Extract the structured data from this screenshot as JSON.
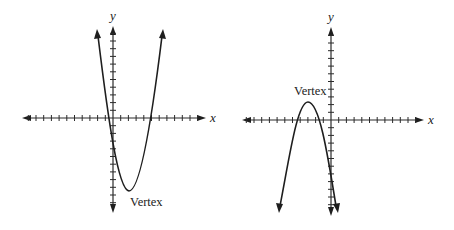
{
  "figure": {
    "graphs": [
      {
        "id": "left",
        "x_axis_label": "x",
        "y_axis_label": "y",
        "annotation": "Vertex",
        "opens": "up",
        "vertex_position": "below x-axis, right of y-axis"
      },
      {
        "id": "right",
        "x_axis_label": "x",
        "y_axis_label": "y",
        "annotation": "Vertex",
        "opens": "down",
        "vertex_position": "above x-axis, left of y-axis"
      }
    ]
  },
  "chart_data": [
    {
      "type": "line",
      "title": "",
      "xlabel": "x",
      "ylabel": "y",
      "grid": false,
      "description": "Upward-opening parabola with vertex below the x-axis",
      "vertex": [
        2,
        -10
      ],
      "x_intercepts": [
        -1,
        5
      ],
      "annotation": "Vertex",
      "xlim": [
        -12,
        12
      ],
      "ylim": [
        -12,
        12
      ]
    },
    {
      "type": "line",
      "title": "",
      "xlabel": "x",
      "ylabel": "y",
      "grid": false,
      "description": "Downward-opening parabola with vertex above the x-axis",
      "vertex": [
        -3,
        2
      ],
      "x_intercepts": [
        -5,
        -1.5
      ],
      "annotation": "Vertex",
      "xlim": [
        -12,
        12
      ],
      "ylim": [
        -12,
        12
      ]
    }
  ]
}
